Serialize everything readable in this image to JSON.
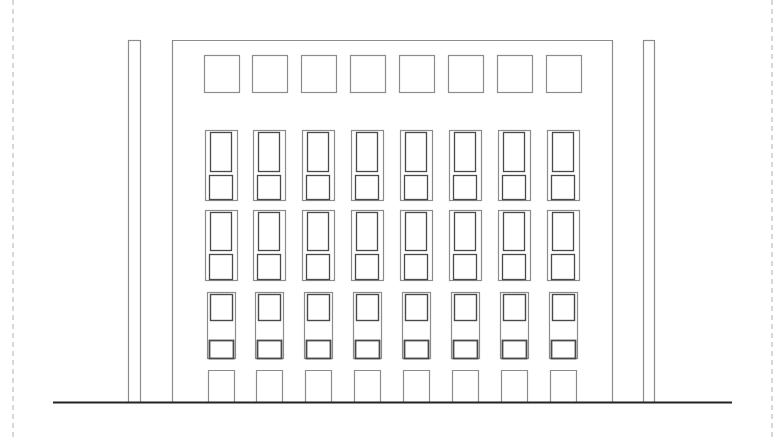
{
  "drawing": {
    "type": "building-elevation",
    "colors": {
      "line": "#8c8c8c",
      "pane": "#4a4a4a",
      "ground": "#222222",
      "border": "#b0b0b0",
      "background": "#ffffff"
    },
    "border": {
      "left_x": 13,
      "right_x": 772
    },
    "ground": {
      "y": 402,
      "x1": 53,
      "x2": 732
    },
    "building": {
      "top_y": 40,
      "outer_left": 128,
      "inner_left": 140,
      "pilaster_left": 172,
      "pilaster_right": 612,
      "inner_right": 643,
      "outer_right": 654
    },
    "columns_x": [
      204,
      252,
      301,
      350,
      399,
      448,
      497,
      546
    ],
    "column_count": 8,
    "top_windows": {
      "y": 55,
      "w": 35,
      "h": 37
    },
    "tall_windows_rows": [
      {
        "frame_y": 130,
        "frame_h": 70,
        "upper_y": 132,
        "upper_h": 39,
        "lower_y": 175,
        "lower_h": 24
      },
      {
        "frame_y": 210,
        "frame_h": 70,
        "upper_y": 212,
        "upper_h": 38,
        "lower_y": 254,
        "lower_h": 25
      }
    ],
    "short_windows_row": {
      "frame_y": 292,
      "frame_h": 66,
      "upper_y": 294,
      "upper_h": 26,
      "lower_y": 340,
      "lower_h": 18
    },
    "ground_openings": {
      "y": 370,
      "h": 32,
      "w": 26
    }
  }
}
